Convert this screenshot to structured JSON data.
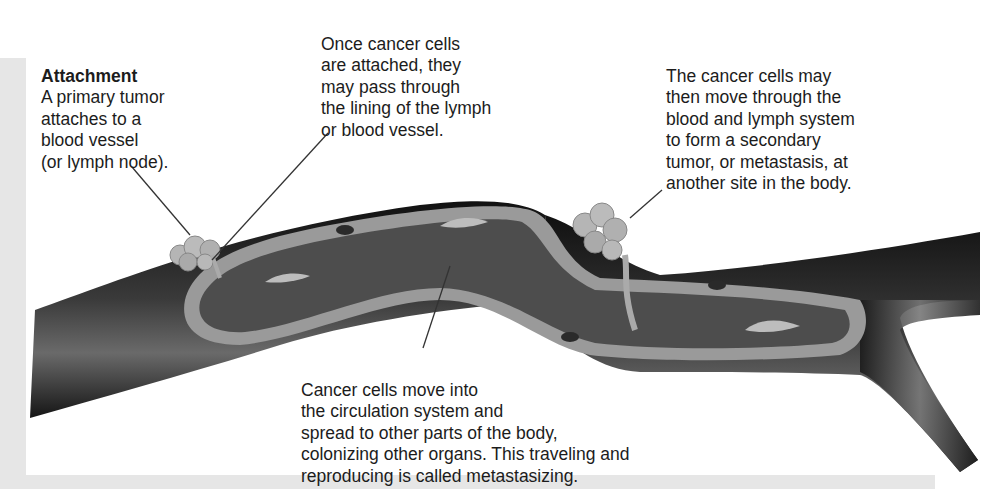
{
  "diagram": {
    "colors": {
      "background": "#ffffff",
      "side_panel": "#e6e6e6",
      "vessel_outer": "#1e1e1e",
      "vessel_wall": "#9a9a9a",
      "vessel_lumen": "#4a4a4a",
      "tumor": "#b5b5b5",
      "leader_line": "#333333"
    },
    "labels": [
      {
        "id": "attachment",
        "title": "Attachment",
        "text": "A primary tumor\nattaches to a\nblood vessel\n(or lymph node)."
      },
      {
        "id": "passing-lining",
        "text": "Once cancer cells\nare attached, they\nmay pass through\nthe lining of the lymph\nor blood vessel."
      },
      {
        "id": "secondary-tumor",
        "text": "The cancer cells may\nthen move through the\nblood and lymph system\nto form a secondary\ntumor, or metastasis, at\nanother site in the body."
      },
      {
        "id": "circulation",
        "text": "Cancer cells move into\nthe circulation system and\nspread to other parts of the body,\ncolonizing other organs. This traveling and\nreproducing is called metastasizing."
      }
    ]
  }
}
